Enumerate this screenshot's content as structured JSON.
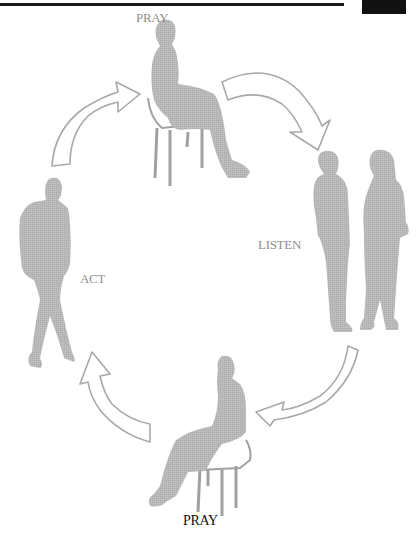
{
  "page": {
    "header_rule": true,
    "corner_tab": true
  },
  "diagram": {
    "type": "cycle",
    "title": "",
    "stages": [
      {
        "id": "pray-top",
        "label": "PRAY",
        "figure": "seated-person-on-chair"
      },
      {
        "id": "listen",
        "label": "LISTEN",
        "figure": "two-standing-people"
      },
      {
        "id": "pray-bottom",
        "label": "PRAY",
        "figure": "seated-person-on-chair"
      },
      {
        "id": "act",
        "label": "ACT",
        "figure": "walking-person"
      }
    ],
    "arrows": [
      {
        "from": "pray-top",
        "to": "listen",
        "direction": "clockwise"
      },
      {
        "from": "listen",
        "to": "pray-bottom",
        "direction": "clockwise"
      },
      {
        "from": "pray-bottom",
        "to": "act",
        "direction": "clockwise"
      },
      {
        "from": "act",
        "to": "pray-top",
        "direction": "clockwise"
      }
    ],
    "colors": {
      "figure_fill": "#b4b4b4",
      "arrow_stroke": "#a8a8a8",
      "arrow_fill": "#ffffff",
      "light_label": "#8f8f8f",
      "dark_label": "#111111"
    }
  }
}
